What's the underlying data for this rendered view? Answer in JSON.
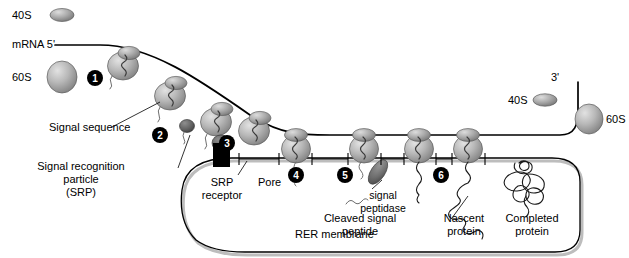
{
  "diagram": {
    "colors": {
      "ribosome_light": "#cfcfcf",
      "ribosome_mid": "#9a9a9a",
      "ribosome_dark": "#6d6d6d",
      "srp_particle": "#5a5a5a",
      "srp_receptor": "#000000",
      "signal_peptidase": "#6a6a6a",
      "line": "#000000",
      "lumen_fill": "#ffffff",
      "lumen_shadow": "#bdbdbd"
    }
  },
  "legend": {
    "small_subunit_left": "40S",
    "large_subunit_left": "60S",
    "small_subunit_right": "40S",
    "large_subunit_right": "60S"
  },
  "mrna": {
    "five_prime_label": "mRNA 5'",
    "three_prime_label": "3'"
  },
  "labels": {
    "signal_sequence": "Signal sequence",
    "srp_line1": "Signal recognition",
    "srp_line2": "particle",
    "srp_line3": "(SRP)",
    "srp_receptor_line1": "SRP",
    "srp_receptor_line2": "receptor",
    "pore": "Pore",
    "signal_peptidase_line1": "signal",
    "signal_peptidase_line2": "peptidase",
    "cleaved_line1": "Cleaved signal",
    "cleaved_line2": "peptide",
    "nascent_line1": "Nascent",
    "nascent_line2": "protein",
    "completed_line1": "Completed",
    "completed_line2": "protein",
    "rer_membrane": "RER membrane"
  },
  "steps": [
    {
      "id": 1,
      "label": "1"
    },
    {
      "id": 2,
      "label": "2"
    },
    {
      "id": 3,
      "label": "3"
    },
    {
      "id": 4,
      "label": "4"
    },
    {
      "id": 5,
      "label": "5"
    },
    {
      "id": 6,
      "label": "6"
    }
  ]
}
